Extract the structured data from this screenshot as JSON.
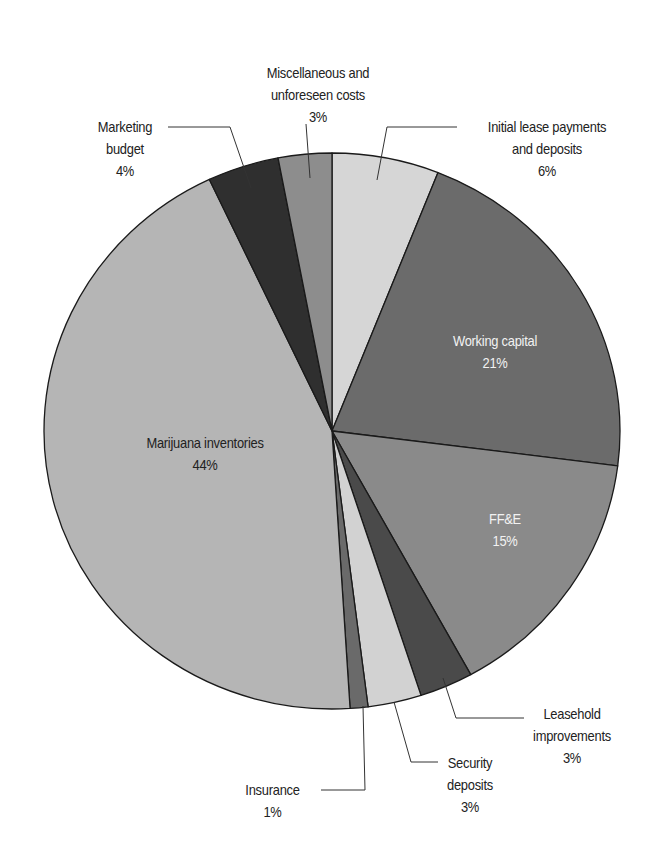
{
  "chart_data": {
    "type": "pie",
    "title": "",
    "start_angle_deg": 0,
    "direction": "clockwise",
    "center": [
      332,
      431
    ],
    "radius": [
      288,
      278
    ],
    "slices": [
      {
        "label": "Initial lease payments and deposits",
        "value": 6,
        "pct_label": "6%",
        "color": "#d6d6d6"
      },
      {
        "label": "Working capital",
        "value": 21,
        "pct_label": "21%",
        "color": "#6b6b6b"
      },
      {
        "label": "FF&E",
        "value": 15,
        "pct_label": "15%",
        "color": "#8a8a8a"
      },
      {
        "label": "Leasehold improvements",
        "value": 3,
        "pct_label": "3%",
        "color": "#4a4a4a"
      },
      {
        "label": "Security deposits",
        "value": 3,
        "pct_label": "3%",
        "color": "#d2d2d2"
      },
      {
        "label": "Insurance",
        "value": 1,
        "pct_label": "1%",
        "color": "#6a6a6a"
      },
      {
        "label": "Marijuana inventories",
        "value": 44,
        "pct_label": "44%",
        "color": "#b5b5b5"
      },
      {
        "label": "Marketing budget",
        "value": 4,
        "pct_label": "4%",
        "color": "#2f2f2f"
      },
      {
        "label": "Miscellaneous and unforeseen costs",
        "value": 3,
        "pct_label": "3%",
        "color": "#8d8d8d"
      }
    ],
    "legend": "none (callout labels)"
  },
  "labels": {
    "initial_lease": {
      "line1": "Initial lease payments",
      "line2": "and deposits",
      "pct": "6%"
    },
    "working_capital": {
      "line1": "Working capital",
      "pct": "21%"
    },
    "ffe": {
      "line1": "FF&E",
      "pct": "15%"
    },
    "leasehold": {
      "line1": "Leasehold",
      "line2": "improvements",
      "pct": "3%"
    },
    "security": {
      "line1": "Security",
      "line2": "deposits",
      "pct": "3%"
    },
    "insurance": {
      "line1": "Insurance",
      "pct": "1%"
    },
    "marijuana": {
      "line1": "Marijuana inventories",
      "pct": "44%"
    },
    "marketing": {
      "line1": "Marketing",
      "line2": "budget",
      "pct": "4%"
    },
    "misc": {
      "line1": "Miscellaneous and",
      "line2": "unforeseen costs",
      "pct": "3%"
    }
  },
  "leaders": [
    {
      "name": "leader-initial-lease",
      "points": [
        [
          457,
          127
        ],
        [
          387,
          127
        ],
        [
          377,
          180
        ]
      ]
    },
    {
      "name": "leader-marketing",
      "points": [
        [
          168,
          127
        ],
        [
          230,
          127
        ],
        [
          251,
          188
        ]
      ]
    },
    {
      "name": "leader-misc",
      "points": [
        [
          306,
          124
        ],
        [
          310,
          178
        ]
      ]
    },
    {
      "name": "leader-leasehold",
      "points": [
        [
          443,
          678
        ],
        [
          456,
          718
        ],
        [
          524,
          718
        ]
      ]
    },
    {
      "name": "leader-security",
      "points": [
        [
          394,
          702
        ],
        [
          411,
          762
        ],
        [
          438,
          762
        ]
      ]
    },
    {
      "name": "leader-insurance",
      "points": [
        [
          363,
          706
        ],
        [
          365,
          790
        ],
        [
          321,
          790
        ]
      ]
    }
  ]
}
